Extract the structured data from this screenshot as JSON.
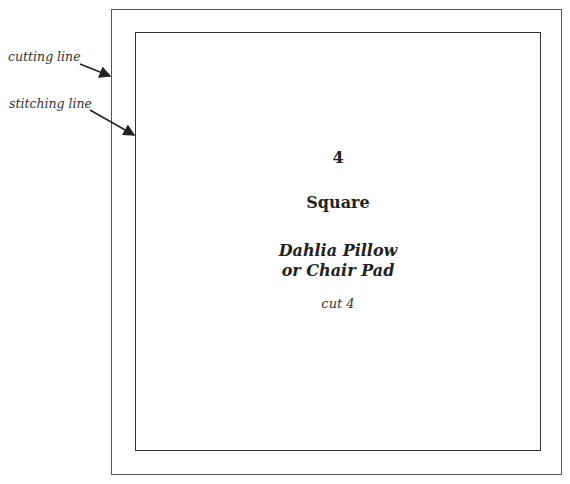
{
  "labels": {
    "cutting_line": "cutting line",
    "stitching_line": "stitching line"
  },
  "pattern": {
    "number": "4",
    "shape": "Square",
    "title_line1": "Dahlia Pillow",
    "title_line2": "or Chair Pad",
    "instruction": "cut 4"
  },
  "colors": {
    "line": "#333333",
    "background": "#ffffff"
  }
}
